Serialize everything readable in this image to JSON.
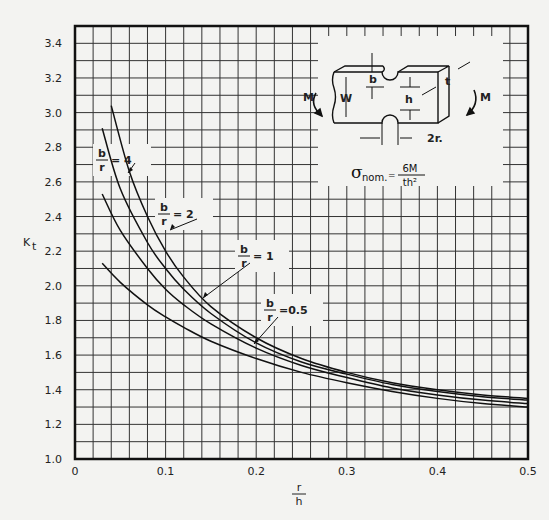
{
  "chart_data": {
    "type": "line",
    "title": "",
    "xlabel": "r/h",
    "ylabel": "Kt",
    "xlim": [
      0,
      0.5
    ],
    "ylim": [
      1.0,
      3.5
    ],
    "grid": true,
    "grid_x_step": 0.02,
    "grid_y_step": 0.1,
    "x_ticks": [
      "0",
      "0.1",
      "0.2",
      "0.3",
      "0.4",
      "0.5"
    ],
    "y_ticks": [
      "1.0",
      "1.2",
      "1.4",
      "1.6",
      "1.8",
      "2.0",
      "2.2",
      "2.4",
      "2.6",
      "2.8",
      "3.0",
      "3.2",
      "3.4"
    ],
    "series": [
      {
        "name": "b/r = 4",
        "label_num": "b",
        "label_den": "r",
        "label_val": "= 4",
        "x": [
          0.04,
          0.06,
          0.08,
          0.1,
          0.12,
          0.15,
          0.2,
          0.25,
          0.3,
          0.35,
          0.4,
          0.45,
          0.5
        ],
        "y": [
          3.04,
          2.66,
          2.4,
          2.2,
          2.05,
          1.88,
          1.7,
          1.58,
          1.5,
          1.44,
          1.4,
          1.37,
          1.35
        ]
      },
      {
        "name": "b/r = 2",
        "label_num": "b",
        "label_den": "r",
        "label_val": "= 2",
        "x": [
          0.03,
          0.05,
          0.08,
          0.1,
          0.12,
          0.15,
          0.2,
          0.25,
          0.3,
          0.35,
          0.4,
          0.45,
          0.5
        ],
        "y": [
          2.91,
          2.56,
          2.25,
          2.1,
          1.98,
          1.84,
          1.67,
          1.56,
          1.49,
          1.43,
          1.39,
          1.36,
          1.34
        ]
      },
      {
        "name": "b/r = 1",
        "label_num": "b",
        "label_den": "r",
        "label_val": "= 1",
        "x": [
          0.03,
          0.05,
          0.08,
          0.1,
          0.12,
          0.15,
          0.2,
          0.25,
          0.3,
          0.35,
          0.4,
          0.45,
          0.5
        ],
        "y": [
          2.53,
          2.32,
          2.1,
          1.98,
          1.89,
          1.78,
          1.64,
          1.54,
          1.47,
          1.41,
          1.37,
          1.34,
          1.32
        ]
      },
      {
        "name": "b/r = 0.5",
        "label_num": "b",
        "label_den": "r",
        "label_val": "=0.5",
        "x": [
          0.03,
          0.05,
          0.08,
          0.1,
          0.12,
          0.15,
          0.2,
          0.25,
          0.3,
          0.35,
          0.4,
          0.45,
          0.5
        ],
        "y": [
          2.13,
          2.02,
          1.89,
          1.82,
          1.76,
          1.68,
          1.58,
          1.5,
          1.44,
          1.39,
          1.35,
          1.32,
          1.3
        ]
      }
    ],
    "annotations": {
      "inset_formula": {
        "sigma": "σ",
        "sub": "nom.",
        "eq": "=",
        "num": "6M",
        "den": "th²"
      },
      "inset_labels": {
        "moment_left": "M",
        "moment_right": "M",
        "w": "W",
        "b": "b",
        "h": "h",
        "t": "t",
        "r": "2r."
      }
    }
  }
}
